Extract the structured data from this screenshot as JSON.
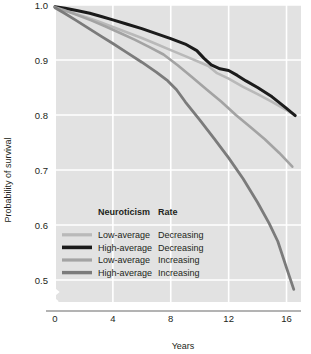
{
  "chart_data": {
    "type": "line",
    "title": "",
    "xlabel": "Years",
    "ylabel": "Probability of survival",
    "xlim": [
      0,
      17
    ],
    "ylim": [
      0.46,
      1.0
    ],
    "xticks": [
      0,
      4,
      8,
      12,
      16
    ],
    "xtick_labels": [
      "0",
      "4",
      "8",
      "12",
      "16"
    ],
    "yticks": [
      0.5,
      0.6,
      0.7,
      0.8,
      0.9,
      1.0
    ],
    "ytick_labels": [
      "0.5",
      "0.6",
      "0.7",
      "0.8",
      "0.9",
      "1.0"
    ],
    "grid": true,
    "grid_color": "#ffffff",
    "plot_background": "#e2e2e2",
    "axis_break": true,
    "legend_position": "lower-left-inside",
    "legend_headers": [
      "Neuroticism",
      "Rate"
    ],
    "series": [
      {
        "name": "Low-average Decreasing",
        "neuroticism": "Low-average",
        "rate": "Decreasing",
        "color": "#b9b9b9",
        "width": 2.6,
        "x": [
          0,
          0.6,
          1.3,
          2.1,
          3.0,
          4.0,
          5.0,
          6.0,
          7.0,
          8.0,
          9.0,
          10.0,
          10.6,
          11.2,
          12.0,
          13.0,
          14.0,
          15.0,
          16.0,
          16.6
        ],
        "y": [
          0.996,
          0.991,
          0.985,
          0.978,
          0.97,
          0.96,
          0.95,
          0.94,
          0.929,
          0.918,
          0.907,
          0.896,
          0.889,
          0.876,
          0.866,
          0.851,
          0.838,
          0.824,
          0.809,
          0.8
        ]
      },
      {
        "name": "High-average Decreasing",
        "neuroticism": "High-average",
        "rate": "Decreasing",
        "color": "#1b1b1b",
        "width": 3.0,
        "x": [
          0,
          0.7,
          1.5,
          2.4,
          3.2,
          4.0,
          5.0,
          6.0,
          7.0,
          8.0,
          9.0,
          9.8,
          10.3,
          10.8,
          11.4,
          12.0,
          12.6,
          13.2,
          14.0,
          15.0,
          16.0,
          16.6
        ],
        "y": [
          0.997,
          0.994,
          0.99,
          0.985,
          0.979,
          0.973,
          0.965,
          0.957,
          0.948,
          0.939,
          0.929,
          0.917,
          0.903,
          0.891,
          0.884,
          0.881,
          0.872,
          0.862,
          0.85,
          0.833,
          0.812,
          0.799
        ]
      },
      {
        "name": "Low-average Increasing",
        "neuroticism": "Low-average",
        "rate": "Increasing",
        "color": "#a3a3a3",
        "width": 2.6,
        "x": [
          0,
          0.7,
          1.5,
          2.5,
          3.5,
          4.5,
          5.5,
          6.5,
          7.5,
          8.5,
          9.5,
          10.5,
          11.5,
          12.5,
          13.5,
          14.5,
          15.5,
          16.4
        ],
        "y": [
          0.996,
          0.99,
          0.982,
          0.972,
          0.961,
          0.949,
          0.937,
          0.924,
          0.91,
          0.89,
          0.868,
          0.846,
          0.824,
          0.8,
          0.778,
          0.756,
          0.731,
          0.706
        ]
      },
      {
        "name": "High-average Increasing",
        "neuroticism": "High-average",
        "rate": "Increasing",
        "color": "#7b7b7b",
        "width": 2.8,
        "x": [
          0,
          0.6,
          1.4,
          2.3,
          3.2,
          4.0,
          5.0,
          6.0,
          7.0,
          7.8,
          8.4,
          9.0,
          10.0,
          11.0,
          12.0,
          13.0,
          14.0,
          14.8,
          15.4,
          16.0,
          16.5
        ],
        "y": [
          0.995,
          0.986,
          0.973,
          0.958,
          0.943,
          0.93,
          0.913,
          0.896,
          0.878,
          0.862,
          0.846,
          0.824,
          0.791,
          0.757,
          0.722,
          0.684,
          0.641,
          0.603,
          0.57,
          0.522,
          0.483
        ]
      }
    ]
  },
  "legend": {
    "header_neuroticism": "Neuroticism",
    "header_rate": "Rate",
    "rows": [
      {
        "neuroticism": "Low-average",
        "rate": "Decreasing"
      },
      {
        "neuroticism": "High-average",
        "rate": "Decreasing"
      },
      {
        "neuroticism": "Low-average",
        "rate": "Increasing"
      },
      {
        "neuroticism": "High-average",
        "rate": "Increasing"
      }
    ]
  },
  "axes": {
    "x_title": "Years",
    "y_title": "Probability of survival"
  }
}
